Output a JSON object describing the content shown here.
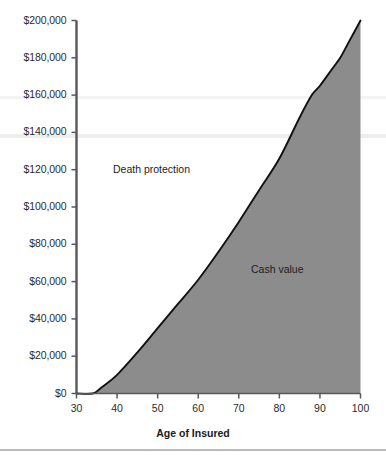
{
  "chart_data": {
    "type": "area",
    "title": "",
    "subtitle": "",
    "xlabel": "Age of Insured",
    "ylabel": "",
    "xlim": [
      30,
      100
    ],
    "ylim": [
      0,
      200000
    ],
    "grid": false,
    "legend_position": "inside-annotations",
    "x_ticks": [
      30,
      40,
      50,
      60,
      70,
      80,
      90,
      100
    ],
    "x_tick_labels": [
      "30",
      "40",
      "50",
      "60",
      "70",
      "80",
      "90",
      "100"
    ],
    "y_ticks": [
      0,
      20000,
      40000,
      60000,
      80000,
      100000,
      120000,
      140000,
      160000,
      180000,
      200000
    ],
    "y_tick_labels": [
      "$0",
      "$20,000",
      "$40,000",
      "$60,000",
      "$80,000",
      "$100,000",
      "$120,000",
      "$140,000",
      "$160,000",
      "$180,000",
      "$200,000"
    ],
    "series": [
      {
        "name": "Cash value",
        "fill_color": "#8c8c8c",
        "line_color": "#111111",
        "x": [
          30,
          34,
          36,
          40,
          45,
          50,
          55,
          60,
          65,
          70,
          75,
          80,
          85,
          88,
          90,
          93,
          95,
          97,
          100
        ],
        "values": [
          0,
          0,
          3000,
          10000,
          22000,
          35000,
          48000,
          61000,
          76000,
          92000,
          109000,
          126000,
          148000,
          160000,
          165000,
          174000,
          180000,
          188000,
          200000
        ]
      }
    ],
    "annotations": [
      {
        "text": "Death protection",
        "region": "above-curve",
        "x": 52,
        "y": 118000
      },
      {
        "text": "Cash value",
        "region": "below-curve",
        "x": 83,
        "y": 63000
      }
    ],
    "axis_color": "#55585c",
    "background_color": "#ffffff"
  },
  "axes": {
    "x_title": "Age of Insured"
  }
}
